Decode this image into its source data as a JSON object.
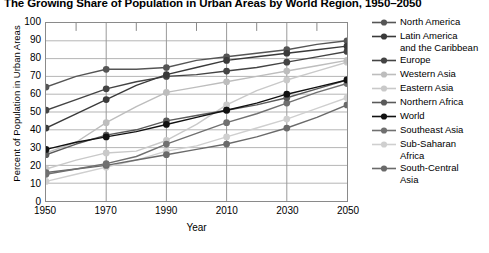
{
  "title": "The Growing Share of Population in Urban Areas by World Region, 1950–2050",
  "axis": {
    "x_title": "Year",
    "y_title": "Percent of Population in Urban Areas",
    "x_ticks": [
      "1950",
      "1970",
      "1990",
      "2010",
      "2030",
      "2050"
    ],
    "y_ticks": [
      "0",
      "10",
      "20",
      "30",
      "40",
      "50",
      "60",
      "70",
      "80",
      "90",
      "100"
    ]
  },
  "legend": {
    "items": [
      {
        "label": "North America",
        "color": "#555555"
      },
      {
        "label": "Latin America\nand the Caribbean",
        "color": "#3a3a3a"
      },
      {
        "label": "Europe",
        "color": "#444444"
      },
      {
        "label": "Western Asia",
        "color": "#bdbdbd"
      },
      {
        "label": "Eastern Asia",
        "color": "#c9c9c9"
      },
      {
        "label": "Northern Africa",
        "color": "#5a5a5a"
      },
      {
        "label": "World",
        "color": "#111111"
      },
      {
        "label": "Southeast Asia",
        "color": "#707070"
      },
      {
        "label": "Sub-Saharan\nAfrica",
        "color": "#cfcfcf"
      },
      {
        "label": "South-Central\nAsia",
        "color": "#6a6a6a"
      }
    ]
  },
  "chart_data": {
    "type": "line",
    "title": "The Growing Share of Population in Urban Areas by World Region, 1950–2050",
    "xlabel": "Year",
    "ylabel": "Percent of Population in Urban Areas",
    "xlim": [
      1950,
      2050
    ],
    "ylim": [
      0,
      100
    ],
    "grid": true,
    "legend_position": "right",
    "x": [
      1950,
      1960,
      1970,
      1980,
      1990,
      2000,
      2010,
      2020,
      2030,
      2040,
      2050
    ],
    "series": [
      {
        "name": "North America",
        "color": "#555555",
        "values": [
          64,
          70,
          74,
          74,
          75,
          79,
          81,
          83,
          85,
          88,
          90
        ]
      },
      {
        "name": "Latin America and the Caribbean",
        "color": "#3a3a3a",
        "values": [
          41,
          49,
          57,
          65,
          71,
          75,
          79,
          81,
          83,
          85,
          87
        ]
      },
      {
        "name": "Europe",
        "color": "#444444",
        "values": [
          51,
          57,
          63,
          67,
          70,
          71,
          73,
          75,
          78,
          81,
          84
        ]
      },
      {
        "name": "Western Asia",
        "color": "#bdbdbd",
        "values": [
          27,
          33,
          44,
          53,
          61,
          64,
          67,
          70,
          73,
          76,
          79
        ]
      },
      {
        "name": "Eastern Asia",
        "color": "#c9c9c9",
        "values": [
          18,
          23,
          27,
          28,
          34,
          43,
          54,
          62,
          68,
          73,
          78
        ]
      },
      {
        "name": "Northern Africa",
        "color": "#5a5a5a",
        "values": [
          26,
          32,
          37,
          40,
          45,
          48,
          51,
          54,
          58,
          63,
          68
        ]
      },
      {
        "name": "World",
        "color": "#111111",
        "values": [
          29,
          33,
          36,
          39,
          43,
          47,
          51,
          55,
          60,
          64,
          68
        ]
      },
      {
        "name": "Southeast Asia",
        "color": "#707070",
        "values": [
          15,
          18,
          21,
          25,
          32,
          38,
          44,
          49,
          55,
          61,
          66
        ]
      },
      {
        "name": "Sub-Saharan Africa",
        "color": "#cfcfcf",
        "values": [
          11,
          15,
          19,
          23,
          28,
          31,
          36,
          41,
          46,
          52,
          58
        ]
      },
      {
        "name": "South-Central Asia",
        "color": "#6a6a6a",
        "values": [
          16,
          18,
          20,
          23,
          26,
          29,
          32,
          36,
          41,
          47,
          54
        ]
      }
    ]
  }
}
